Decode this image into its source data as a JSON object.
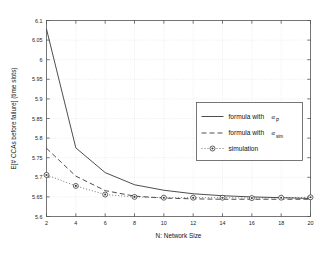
{
  "chart_data": {
    "type": "line",
    "title": "",
    "xlabel": "N: Network Size",
    "ylabel": "E[# CCAs before failure]  (time slots)",
    "xlim": [
      2,
      20
    ],
    "ylim": [
      5.6,
      6.1
    ],
    "grid": true,
    "legend_position": "center-right",
    "xticks": [
      "2",
      "4",
      "6",
      "8",
      "10",
      "12",
      "14",
      "16",
      "18",
      "20"
    ],
    "xtick_values": [
      2,
      4,
      6,
      8,
      10,
      12,
      14,
      16,
      18,
      20
    ],
    "yticks": [
      "5.6",
      "5.65",
      "5.7",
      "5.75",
      "5.8",
      "5.85",
      "5.9",
      "5.95",
      "6",
      "6.05",
      "6.1"
    ],
    "ytick_values": [
      5.6,
      5.65,
      5.7,
      5.75,
      5.8,
      5.85,
      5.9,
      5.95,
      6.0,
      6.05,
      6.1
    ],
    "x": [
      2,
      4,
      6,
      8,
      10,
      12,
      14,
      16,
      18,
      20
    ],
    "series": [
      {
        "name": "formula with α_P",
        "label_main": "formula with ",
        "label_symbol": "α",
        "label_sub": "P",
        "style": "solid",
        "color": "#3a3a3a",
        "marker": "none",
        "values": [
          6.078,
          5.775,
          5.712,
          5.681,
          5.667,
          5.658,
          5.653,
          5.65,
          5.648,
          5.646
        ]
      },
      {
        "name": "formula with α_sim",
        "label_main": "formula with ",
        "label_symbol": "α",
        "label_sub": "sim",
        "style": "dashed",
        "color": "#3a3a3a",
        "marker": "none",
        "values": [
          5.774,
          5.703,
          5.666,
          5.652,
          5.647,
          5.645,
          5.644,
          5.644,
          5.644,
          5.644
        ]
      },
      {
        "name": "simulation",
        "label_main": "simulation",
        "label_symbol": "",
        "label_sub": "",
        "style": "dotted",
        "color": "#4a4a4a",
        "marker": "circle-dot",
        "values": [
          5.706,
          5.678,
          5.656,
          5.65,
          5.648,
          5.648,
          5.648,
          5.647,
          5.648,
          5.649
        ]
      }
    ]
  }
}
